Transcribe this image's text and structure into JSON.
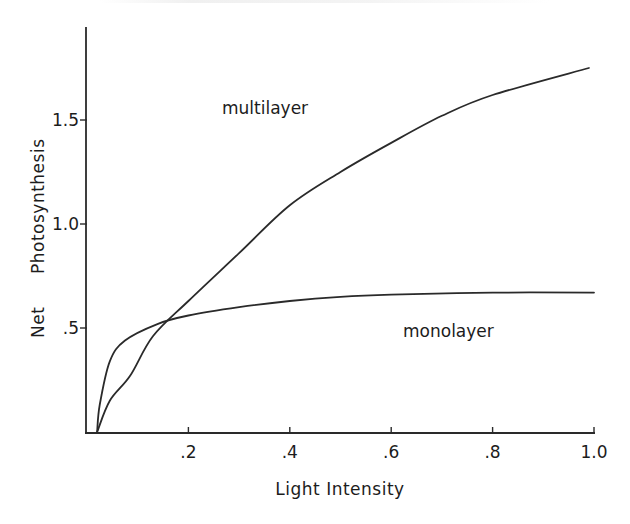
{
  "chart_data": {
    "type": "line",
    "title": "",
    "xlabel": "Light Intensity",
    "ylabel": "Net Photosynthesis",
    "xlim": [
      0,
      1.0
    ],
    "ylim": [
      0,
      1.95
    ],
    "grid": false,
    "legend": "inline labels",
    "x_ticks": [
      {
        "value": 0.2,
        "label": ".2"
      },
      {
        "value": 0.4,
        "label": ".4"
      },
      {
        "value": 0.6,
        "label": ".6"
      },
      {
        "value": 0.8,
        "label": ".8"
      },
      {
        "value": 1.0,
        "label": "1.0"
      }
    ],
    "y_ticks": [
      {
        "value": 0.5,
        "label": ".5"
      },
      {
        "value": 1.0,
        "label": "1.0"
      },
      {
        "value": 1.5,
        "label": "1.5"
      }
    ],
    "series": [
      {
        "name": "multilayer",
        "label_position": {
          "x": 0.265,
          "y": 1.56
        },
        "x": [
          0.02,
          0.045,
          0.085,
          0.13,
          0.2,
          0.3,
          0.4,
          0.5,
          0.6,
          0.7,
          0.8,
          0.99
        ],
        "y": [
          0.0,
          0.15,
          0.27,
          0.46,
          0.63,
          0.86,
          1.09,
          1.25,
          1.39,
          1.52,
          1.62,
          1.75
        ]
      },
      {
        "name": "monolayer",
        "label_position": {
          "x": 0.625,
          "y": 0.48
        },
        "x": [
          0.02,
          0.025,
          0.045,
          0.075,
          0.14,
          0.2,
          0.3,
          0.4,
          0.5,
          0.6,
          0.8,
          1.0
        ],
        "y": [
          0.0,
          0.13,
          0.34,
          0.44,
          0.52,
          0.56,
          0.6,
          0.63,
          0.65,
          0.66,
          0.67,
          0.67
        ]
      }
    ],
    "annotations": [
      {
        "text": "multilayer",
        "near_series": "multilayer"
      },
      {
        "text": "monolayer",
        "near_series": "monolayer"
      }
    ]
  },
  "labels": {
    "xlabel": "Light Intensity",
    "ylabel_word1": "Net",
    "ylabel_word2": "Photosynthesis",
    "series_multilayer": "multilayer",
    "series_monolayer": "monolayer"
  },
  "colors": {
    "ink": "#2a2a2a",
    "background": "#ffffff"
  }
}
